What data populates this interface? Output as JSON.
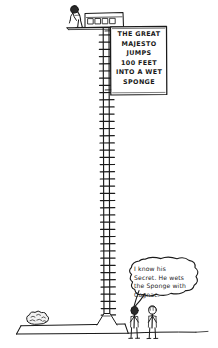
{
  "scene": {
    "title": "The Great Majesto high-dive cartoon",
    "background_color": "#ffffff",
    "ink_color": "#1a1a1a"
  },
  "sign": {
    "name": "billboard-sign",
    "lines": [
      "THE GREAT",
      "MAJESTO",
      "JUMPS",
      "100 FEET",
      "INTO A WET",
      "SPONGE"
    ],
    "line_1": "THE GREAT",
    "line_2": "MAJESTO",
    "line_3": "JUMPS",
    "line_4": "100 FEET",
    "line_5": "INTO A WET",
    "line_6": "SPONGE"
  },
  "speech_bubble": {
    "name": "spectator-speech-bubble",
    "speaker": "left-spectator",
    "lines": [
      "I know his",
      "Secret. He wets",
      "the Sponge with",
      "Cognac."
    ],
    "line_1": "I know his",
    "line_2": "Secret. He wets",
    "line_3": "the Sponge with",
    "line_4": "Cognac."
  },
  "figures": {
    "climber": {
      "name": "majesto-climber-figure",
      "description": "figure bent over looking down from top platform"
    },
    "spectator_left": {
      "name": "left-spectator-figure",
      "description": "standing spectator speaking"
    },
    "spectator_right": {
      "name": "right-spectator-figure",
      "description": "standing spectator listening"
    }
  },
  "structures": {
    "ladder": {
      "name": "high-dive-ladder",
      "rung_count": 40
    },
    "top_platform": {
      "name": "top-platform-booth",
      "window_count": 4
    },
    "base": {
      "name": "raised-ground-platform"
    },
    "bush": {
      "name": "bush-shrub"
    },
    "ground": {
      "name": "ground-line"
    }
  }
}
